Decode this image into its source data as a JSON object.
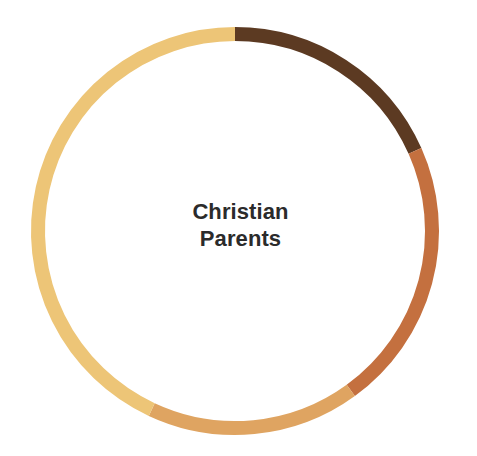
{
  "chart_data": {
    "type": "pie",
    "title": "Christian Parents",
    "subtitle": "",
    "xlabel": "",
    "ylabel": "",
    "variant": "donut",
    "legend_position": "none",
    "grid": false,
    "center_label_lines": [
      "Christian",
      "Parents"
    ],
    "geometry": {
      "center_x": 235,
      "center_y": 231,
      "outer_radius": 204,
      "ring_thickness": 14,
      "start_angle_deg": 0,
      "direction": "clockwise"
    },
    "background_color": "#ffffff",
    "label_color": "#2b2b2b",
    "categories": [
      "Segment 1",
      "Segment 2",
      "Segment 3",
      "Segment 4"
    ],
    "values": [
      18.3,
      21.7,
      17.0,
      43.0
    ],
    "units": "percent",
    "segments": [
      {
        "name": "Segment 1",
        "color": "#5c3a22",
        "value": 18.3,
        "start_angle_deg": 0,
        "end_angle_deg": 66
      },
      {
        "name": "Segment 2",
        "color": "#c4703f",
        "value": 21.7,
        "start_angle_deg": 66,
        "end_angle_deg": 144
      },
      {
        "name": "Segment 3",
        "color": "#dfa461",
        "value": 17.0,
        "start_angle_deg": 144,
        "end_angle_deg": 205
      },
      {
        "name": "Segment 4",
        "color": "#edc577",
        "value": 43.0,
        "start_angle_deg": 205,
        "end_angle_deg": 360
      }
    ]
  }
}
